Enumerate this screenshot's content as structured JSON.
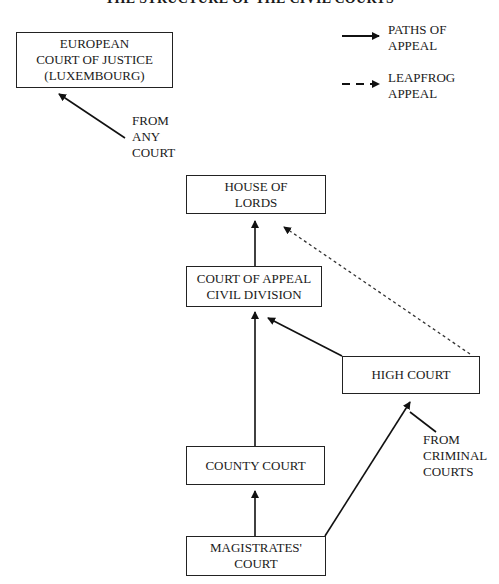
{
  "title": "THE STRUCTURE OF THE CIVIL COURTS",
  "legend": {
    "solid": {
      "line1": "PATHS OF",
      "line2": "APPEAL"
    },
    "dashed": {
      "line1": "LEAPFROG",
      "line2": "APPEAL"
    }
  },
  "nodes": {
    "ecj": {
      "line1": "EUROPEAN",
      "line2": "COURT OF JUSTICE",
      "line3": "(LUXEMBOURG)"
    },
    "lords": {
      "line1": "HOUSE OF",
      "line2": "LORDS"
    },
    "appeal": {
      "line1": "COURT OF APPEAL",
      "line2": "CIVIL DIVISION"
    },
    "high": {
      "line1": "HIGH COURT"
    },
    "county": {
      "line1": "COUNTY COURT"
    },
    "magistrates": {
      "line1": "MAGISTRATES'",
      "line2": "COURT"
    }
  },
  "annotations": {
    "any_court": {
      "line1": "FROM",
      "line2": "ANY",
      "line3": "COURT"
    },
    "criminal": {
      "line1": "FROM",
      "line2": "CRIMINAL",
      "line3": "COURTS"
    }
  },
  "edges": [
    {
      "from": "FROM ANY COURT",
      "to": "EUROPEAN COURT OF JUSTICE",
      "style": "solid"
    },
    {
      "from": "COURT OF APPEAL CIVIL DIVISION",
      "to": "HOUSE OF LORDS",
      "style": "solid"
    },
    {
      "from": "HIGH COURT",
      "to": "COURT OF APPEAL CIVIL DIVISION",
      "style": "solid"
    },
    {
      "from": "COUNTY COURT",
      "to": "COURT OF APPEAL CIVIL DIVISION",
      "style": "solid"
    },
    {
      "from": "MAGISTRATES' COURT",
      "to": "COUNTY COURT",
      "style": "solid"
    },
    {
      "from": "MAGISTRATES' COURT",
      "to": "HIGH COURT",
      "style": "solid"
    },
    {
      "from": "FROM CRIMINAL COURTS",
      "to": "HIGH COURT",
      "style": "solid"
    },
    {
      "from": "HIGH COURT",
      "to": "HOUSE OF LORDS",
      "style": "dashed"
    }
  ]
}
